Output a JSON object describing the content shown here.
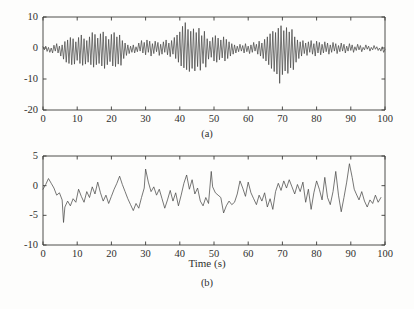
{
  "figure": {
    "background_color": "#fdfdfc",
    "trace_color": "#4a4a48",
    "axis_color": "#3a3a38"
  },
  "chart_data": [
    {
      "type": "line",
      "panel_id": "a",
      "caption": "(a)",
      "title": "",
      "xlabel": "",
      "ylabel": "",
      "xlim": [
        0,
        100
      ],
      "ylim": [
        -20,
        10
      ],
      "grid": false,
      "legend": null,
      "xticks": [
        0,
        10,
        20,
        30,
        40,
        50,
        60,
        70,
        80,
        90,
        100
      ],
      "xticklabels": [
        "0",
        "10",
        "20",
        "30",
        "40",
        "50",
        "60",
        "70",
        "80",
        "90",
        "100"
      ],
      "yticks": [
        10,
        0,
        -10,
        -20
      ],
      "yticklabels": [
        "10",
        "0",
        "-10",
        "-20"
      ],
      "series": [
        {
          "name": "signal-a",
          "x": [
            0.0,
            0.4,
            0.8,
            1.2,
            1.6,
            2.0,
            2.4,
            2.8,
            3.2,
            3.6,
            4.0,
            4.4,
            4.8,
            5.2,
            5.6,
            6.0,
            6.4,
            6.8,
            7.2,
            7.6,
            8.0,
            8.4,
            8.8,
            9.2,
            9.6,
            10.0,
            10.4,
            10.8,
            11.2,
            11.6,
            12.0,
            12.4,
            12.8,
            13.2,
            13.6,
            14.0,
            14.4,
            14.8,
            15.2,
            15.6,
            16.0,
            16.4,
            16.8,
            17.2,
            17.6,
            18.0,
            18.4,
            18.8,
            19.2,
            19.6,
            20.0,
            20.4,
            20.8,
            21.2,
            21.6,
            22.0,
            22.4,
            22.8,
            23.2,
            23.6,
            24.0,
            24.4,
            24.8,
            25.2,
            25.6,
            26.0,
            26.4,
            26.8,
            27.2,
            27.6,
            28.0,
            28.4,
            28.8,
            29.2,
            29.6,
            30.0,
            30.4,
            30.8,
            31.2,
            31.6,
            32.0,
            32.4,
            32.8,
            33.2,
            33.6,
            34.0,
            34.4,
            34.8,
            35.2,
            35.6,
            36.0,
            36.4,
            36.8,
            37.2,
            37.6,
            38.0,
            38.4,
            38.8,
            39.2,
            39.6,
            40.0,
            40.4,
            40.8,
            41.2,
            41.6,
            42.0,
            42.4,
            42.8,
            43.2,
            43.6,
            44.0,
            44.4,
            44.8,
            45.2,
            45.6,
            46.0,
            46.4,
            46.8,
            47.2,
            47.6,
            48.0,
            48.4,
            48.8,
            49.2,
            49.6,
            50.0,
            50.4,
            50.8,
            51.2,
            51.6,
            52.0,
            52.4,
            52.8,
            53.2,
            53.6,
            54.0,
            54.4,
            54.8,
            55.2,
            55.6,
            56.0,
            56.4,
            56.8,
            57.2,
            57.6,
            58.0,
            58.4,
            58.8,
            59.2,
            59.6,
            60.0,
            60.4,
            60.8,
            61.2,
            61.6,
            62.0,
            62.4,
            62.8,
            63.2,
            63.6,
            64.0,
            64.4,
            64.8,
            65.2,
            65.6,
            66.0,
            66.4,
            66.8,
            67.2,
            67.6,
            68.0,
            68.4,
            68.8,
            69.2,
            69.6,
            70.0,
            70.4,
            70.8,
            71.2,
            71.6,
            72.0,
            72.4,
            72.8,
            73.2,
            73.6,
            74.0,
            74.4,
            74.8,
            75.2,
            75.6,
            76.0,
            76.4,
            76.8,
            77.2,
            77.6,
            78.0,
            78.4,
            78.8,
            79.2,
            79.6,
            80.0,
            80.4,
            80.8,
            81.2,
            81.6,
            82.0,
            82.4,
            82.8,
            83.2,
            83.6,
            84.0,
            84.4,
            84.8,
            85.2,
            85.6,
            86.0,
            86.4,
            86.8,
            87.2,
            87.6,
            88.0,
            88.4,
            88.8,
            89.2,
            89.6,
            90.0,
            90.4,
            90.8,
            91.2,
            91.6,
            92.0,
            92.4,
            92.8,
            93.2,
            93.6,
            94.0,
            94.4,
            94.8,
            95.2,
            95.6,
            96.0,
            96.4,
            96.8,
            97.2,
            97.6,
            98.0,
            98.4,
            98.8,
            99.2,
            99.6,
            100.0
          ],
          "y": [
            0.4,
            -0.6,
            0.6,
            -1.1,
            0.2,
            -1.4,
            0.0,
            -1.6,
            0.9,
            -1.0,
            1.4,
            -1.6,
            0.6,
            -2.6,
            1.0,
            -3.6,
            2.1,
            -4.6,
            2.6,
            -5.0,
            3.4,
            -5.4,
            3.0,
            -5.2,
            2.0,
            -4.0,
            3.4,
            -5.0,
            4.2,
            -5.6,
            3.0,
            -5.2,
            2.4,
            -4.6,
            3.6,
            -5.4,
            5.0,
            -6.2,
            4.4,
            -5.4,
            3.2,
            -5.0,
            4.6,
            -5.8,
            5.2,
            -6.6,
            3.8,
            -5.4,
            2.8,
            -4.4,
            4.4,
            -5.8,
            5.0,
            -6.0,
            3.6,
            -5.2,
            4.2,
            -5.6,
            2.4,
            -3.4,
            1.6,
            -2.4,
            1.0,
            -1.8,
            0.6,
            -1.4,
            1.0,
            -1.6,
            0.4,
            -1.2,
            1.6,
            -1.0,
            2.4,
            -1.6,
            1.8,
            -2.2,
            2.6,
            -1.4,
            2.2,
            -2.6,
            1.4,
            -1.8,
            2.2,
            -1.2,
            1.8,
            -2.4,
            1.2,
            -2.0,
            2.0,
            -1.4,
            2.6,
            -2.2,
            1.6,
            -2.8,
            2.4,
            -2.0,
            3.4,
            -3.4,
            4.2,
            -4.6,
            5.2,
            -5.8,
            7.0,
            -6.4,
            8.2,
            -7.0,
            6.0,
            -7.6,
            5.4,
            -6.6,
            6.2,
            -7.4,
            5.0,
            -6.0,
            6.4,
            -7.2,
            4.0,
            -5.0,
            5.4,
            -6.2,
            3.0,
            -3.6,
            2.2,
            -3.0,
            3.4,
            -4.2,
            4.0,
            -4.6,
            3.2,
            -3.8,
            2.6,
            -3.2,
            3.6,
            -4.2,
            2.8,
            -3.4,
            2.0,
            -2.6,
            1.4,
            -2.0,
            1.0,
            -1.6,
            0.6,
            -1.2,
            1.2,
            -1.0,
            0.8,
            -1.6,
            1.4,
            -1.2,
            0.6,
            -1.8,
            1.0,
            -1.4,
            1.8,
            -1.0,
            1.2,
            -2.0,
            2.2,
            -2.6,
            1.6,
            -3.4,
            2.8,
            -4.2,
            3.6,
            -5.4,
            4.6,
            -6.6,
            5.4,
            -7.6,
            5.0,
            -8.4,
            6.4,
            -11.4,
            7.2,
            -8.6,
            5.6,
            -7.4,
            6.6,
            -8.2,
            5.2,
            -6.4,
            6.0,
            -7.0,
            3.6,
            -4.6,
            2.6,
            -3.4,
            2.0,
            -2.6,
            2.4,
            -1.8,
            1.6,
            -2.4,
            2.0,
            -1.4,
            2.4,
            -2.0,
            1.4,
            -2.6,
            2.2,
            -1.6,
            1.8,
            -2.2,
            1.2,
            -1.6,
            2.0,
            -1.2,
            1.6,
            -2.0,
            1.0,
            -1.4,
            1.8,
            -1.0,
            1.4,
            -1.8,
            0.8,
            -1.2,
            1.6,
            -1.0,
            1.2,
            -1.6,
            0.6,
            -1.0,
            1.4,
            -0.8,
            1.0,
            -1.4,
            0.4,
            -0.8,
            1.2,
            -0.6,
            0.8,
            -1.2,
            0.2,
            -0.6,
            1.0,
            -0.4,
            0.6,
            -1.0,
            0.2,
            -0.6,
            0.8,
            -0.4,
            0.4,
            -0.8,
            0.0,
            -1.0,
            0.4,
            -1.4,
            -0.4,
            -1.8,
            -1.0,
            -2.0,
            -1.4,
            -2.4,
            -1.8
          ]
        }
      ]
    },
    {
      "type": "line",
      "panel_id": "b",
      "caption": "(b)",
      "title": "",
      "xlabel": "Time (s)",
      "ylabel": "",
      "xlim": [
        0,
        100
      ],
      "ylim": [
        -10,
        5
      ],
      "grid": false,
      "legend": null,
      "xticks": [
        0,
        10,
        20,
        30,
        40,
        50,
        60,
        70,
        80,
        90,
        100
      ],
      "xticklabels": [
        "0",
        "10",
        "20",
        "30",
        "40",
        "50",
        "60",
        "70",
        "80",
        "90",
        "100"
      ],
      "yticks": [
        5,
        0,
        -5,
        -10
      ],
      "yticklabels": [
        "5",
        "0",
        "-5",
        "-10"
      ],
      "series": [
        {
          "name": "signal-b",
          "x": [
            0.0,
            0.8,
            1.6,
            2.4,
            3.2,
            4.0,
            4.8,
            5.6,
            6.0,
            6.4,
            7.2,
            8.0,
            8.8,
            9.6,
            10.4,
            11.2,
            12.0,
            12.8,
            13.6,
            14.4,
            15.2,
            16.0,
            16.8,
            17.6,
            18.4,
            19.2,
            20.0,
            20.8,
            21.6,
            22.4,
            23.2,
            24.0,
            24.8,
            25.6,
            26.4,
            27.2,
            28.0,
            28.8,
            29.6,
            30.0,
            30.8,
            31.6,
            32.4,
            33.2,
            34.0,
            34.8,
            35.6,
            36.4,
            37.2,
            38.0,
            38.8,
            39.6,
            40.4,
            41.2,
            42.0,
            42.8,
            43.6,
            44.4,
            45.2,
            46.0,
            46.8,
            47.6,
            48.4,
            49.2,
            49.6,
            50.4,
            51.2,
            52.0,
            52.8,
            53.6,
            54.4,
            55.2,
            56.0,
            56.8,
            57.6,
            58.4,
            59.2,
            60.0,
            60.8,
            61.6,
            62.4,
            63.2,
            64.0,
            64.8,
            65.6,
            66.4,
            67.2,
            68.0,
            68.8,
            69.6,
            70.4,
            71.2,
            72.0,
            72.8,
            73.6,
            74.4,
            75.2,
            76.0,
            76.8,
            77.6,
            78.4,
            79.2,
            80.0,
            80.8,
            81.6,
            82.4,
            83.2,
            84.0,
            84.8,
            85.6,
            86.4,
            87.2,
            88.0,
            88.8,
            89.6,
            90.4,
            91.0,
            91.6,
            92.4,
            93.2,
            94.0,
            94.8,
            95.6,
            96.4,
            97.2,
            98.0,
            98.8,
            99.6,
            100.0
          ],
          "y": [
            -0.6,
            0.2,
            1.2,
            0.4,
            -0.4,
            -1.6,
            -1.2,
            -2.4,
            -6.2,
            -3.6,
            -2.6,
            -3.4,
            -2.2,
            -2.8,
            -0.6,
            -1.8,
            -2.8,
            -1.0,
            -2.0,
            -0.2,
            -1.4,
            0.6,
            -1.2,
            -2.6,
            -1.6,
            -3.0,
            -1.8,
            -0.6,
            0.4,
            1.6,
            0.2,
            -1.0,
            -2.2,
            -3.2,
            -4.2,
            -3.0,
            -3.8,
            -2.0,
            -0.4,
            2.8,
            0.6,
            -1.0,
            -0.2,
            -1.6,
            -0.6,
            -2.2,
            -3.8,
            -2.4,
            -0.8,
            -2.6,
            -1.2,
            -3.4,
            -1.6,
            0.4,
            1.8,
            -0.6,
            1.0,
            -1.4,
            -0.4,
            -2.6,
            -3.4,
            -2.0,
            -3.0,
            2.4,
            -0.2,
            -1.2,
            -1.6,
            -2.0,
            -4.6,
            -3.4,
            -2.6,
            -3.2,
            -2.8,
            -1.4,
            0.8,
            -0.4,
            -1.8,
            0.6,
            -1.2,
            -2.2,
            -3.2,
            -1.6,
            -2.6,
            -1.2,
            -3.6,
            -2.2,
            -4.0,
            -1.0,
            0.4,
            -0.8,
            0.8,
            -0.4,
            1.0,
            -0.2,
            -1.4,
            0.2,
            -1.0,
            0.6,
            -2.8,
            -0.6,
            -4.0,
            -1.2,
            0.8,
            -0.6,
            -2.4,
            1.4,
            -2.0,
            -3.2,
            -1.0,
            2.4,
            -1.6,
            -4.4,
            -2.0,
            0.6,
            3.7,
            1.4,
            -0.6,
            -1.4,
            -2.4,
            -1.0,
            -2.6,
            -3.6,
            -2.4,
            -3.0,
            -1.6,
            -2.8,
            -2.0
          ]
        }
      ]
    }
  ]
}
